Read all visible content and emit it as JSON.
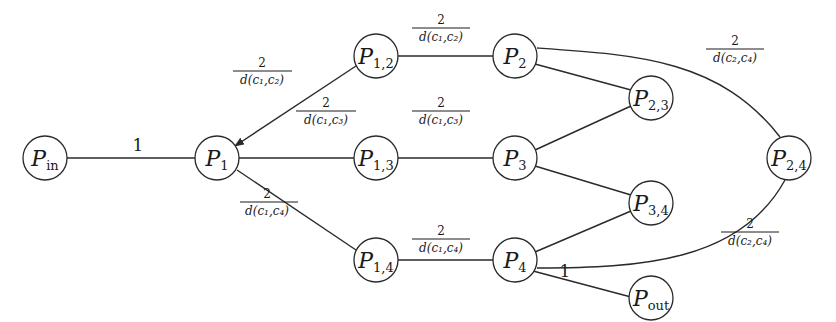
{
  "diagram": {
    "nodes": [
      {
        "id": "P_in",
        "base": "P",
        "sub": "in",
        "x": 45,
        "y": 158
      },
      {
        "id": "P1",
        "base": "P",
        "sub": "1",
        "x": 217,
        "y": 158
      },
      {
        "id": "P12",
        "base": "P",
        "sub": "1,2",
        "x": 376,
        "y": 56
      },
      {
        "id": "P13",
        "base": "P",
        "sub": "1,3",
        "x": 376,
        "y": 158
      },
      {
        "id": "P14",
        "base": "P",
        "sub": "1,4",
        "x": 376,
        "y": 260
      },
      {
        "id": "P2",
        "base": "P",
        "sub": "2",
        "x": 515,
        "y": 56
      },
      {
        "id": "P3",
        "base": "P",
        "sub": "3",
        "x": 515,
        "y": 158
      },
      {
        "id": "P4",
        "base": "P",
        "sub": "4",
        "x": 515,
        "y": 260
      },
      {
        "id": "P23",
        "base": "P",
        "sub": "2,3",
        "x": 651,
        "y": 98
      },
      {
        "id": "P34",
        "base": "P",
        "sub": "3,4",
        "x": 651,
        "y": 203
      },
      {
        "id": "P24",
        "base": "P",
        "sub": "2,4",
        "x": 789,
        "y": 158
      },
      {
        "id": "P_out",
        "base": "P",
        "sub": "out",
        "x": 651,
        "y": 305
      }
    ],
    "edge_labels": {
      "in_to_1": "1",
      "p12_to_1": {
        "num": "2",
        "den": "d(c₁,c₂)"
      },
      "p1_to_13": {
        "num": "2",
        "den": "d(c₁,c₃)"
      },
      "p1_to_14": {
        "num": "2",
        "den": "d(c₁,c₄)"
      },
      "p12_to_2": {
        "num": "2",
        "den": "d(c₁,c₂)"
      },
      "p13_to_3": {
        "num": "2",
        "den": "d(c₁,c₃)"
      },
      "p14_to_4": {
        "num": "2",
        "den": "d(c₁,c₄)"
      },
      "p2_to_24": {
        "num": "2",
        "den": "d(c₂,c₄)"
      },
      "p4_to_24": {
        "num": "2",
        "den": "d(c₂,c₄)"
      },
      "p4_to_out": "1"
    },
    "edges": [
      [
        "P_in",
        "P1"
      ],
      [
        "P12",
        "P1"
      ],
      [
        "P1",
        "P13"
      ],
      [
        "P1",
        "P14"
      ],
      [
        "P12",
        "P2"
      ],
      [
        "P13",
        "P3"
      ],
      [
        "P14",
        "P4"
      ],
      [
        "P2",
        "P23"
      ],
      [
        "P3",
        "P23"
      ],
      [
        "P3",
        "P34"
      ],
      [
        "P4",
        "P34"
      ],
      [
        "P2",
        "P24"
      ],
      [
        "P4",
        "P24"
      ],
      [
        "P4",
        "P_out"
      ]
    ]
  }
}
